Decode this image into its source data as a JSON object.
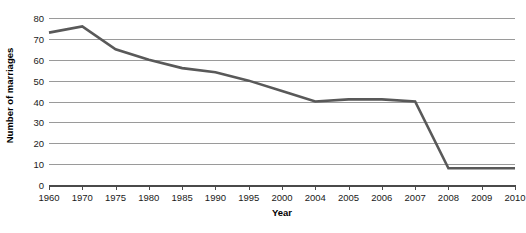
{
  "chart_data": {
    "type": "line",
    "title": "",
    "xlabel": "Year",
    "ylabel": "Number of marriages",
    "categories": [
      "1960",
      "1970",
      "1975",
      "1980",
      "1985",
      "1990",
      "1995",
      "2000",
      "2004",
      "2005",
      "2006",
      "2007",
      "2008",
      "2009",
      "2010"
    ],
    "values": [
      73,
      76,
      65,
      60,
      56,
      54,
      50,
      45,
      40,
      41,
      41,
      40,
      8,
      8,
      8
    ],
    "series": [
      {
        "name": "Number of marriages",
        "values": [
          73,
          76,
          65,
          60,
          56,
          54,
          50,
          45,
          40,
          41,
          41,
          40,
          8,
          8,
          8
        ]
      }
    ],
    "ylim": [
      0,
      80
    ],
    "yticks": [
      0,
      10,
      20,
      30,
      40,
      50,
      60,
      70,
      80
    ],
    "ytick_labels": [
      "0",
      "10",
      "20",
      "30",
      "40",
      "50",
      "60",
      "70",
      "80"
    ],
    "grid": true,
    "grid_axis": "y",
    "legend": false,
    "legend_position": "none",
    "line_color": "#595959",
    "grid_color": "#9a9a9a",
    "axis_color": "#4a4a4a",
    "background_color": "#ffffff",
    "markers": false
  }
}
